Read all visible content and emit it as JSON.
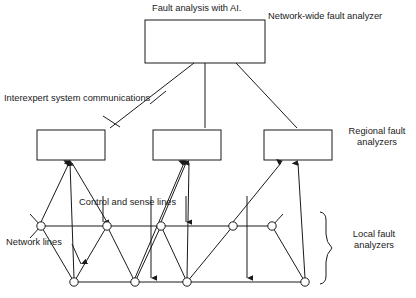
{
  "diagram": {
    "labels": {
      "top_box_caption": "Fault analysis with AI.",
      "network_wide": "Network-wide fault analyzer",
      "interexpert": "Interexpert system communications",
      "regional_line1": "Regional fault",
      "regional_line2": "analyzers",
      "control_sense": "Control and sense lines",
      "network_lines": "Network lines",
      "local_line1": "Local fault",
      "local_line2": "analyzers"
    },
    "colors": {
      "stroke": "#1a1a1a",
      "background": "#ffffff",
      "node_fill": "#ffffff"
    },
    "boxes": [
      {
        "name": "network-wide-fault-analyzer-box",
        "x": 145,
        "y": 20,
        "w": 120,
        "h": 43
      },
      {
        "name": "regional-fault-analyzer-box-left",
        "x": 37,
        "y": 130,
        "w": 68,
        "h": 30
      },
      {
        "name": "regional-fault-analyzer-box-center",
        "x": 153,
        "y": 130,
        "w": 68,
        "h": 30
      },
      {
        "name": "regional-fault-analyzer-box-right",
        "x": 264,
        "y": 130,
        "w": 68,
        "h": 30
      }
    ],
    "nodes_upper": [
      {
        "id": "n1",
        "x": 41,
        "y": 226
      },
      {
        "id": "n2",
        "x": 107,
        "y": 226
      },
      {
        "id": "n3",
        "x": 161,
        "y": 226
      },
      {
        "id": "n4",
        "x": 233,
        "y": 226
      },
      {
        "id": "n5",
        "x": 272,
        "y": 226
      }
    ],
    "nodes_lower": [
      {
        "id": "m1",
        "x": 74,
        "y": 282
      },
      {
        "id": "m2",
        "x": 135,
        "y": 282
      },
      {
        "id": "m3",
        "x": 187,
        "y": 282
      },
      {
        "id": "m4",
        "x": 305,
        "y": 282
      }
    ],
    "node_radius": 4.2,
    "brace": {
      "name": "local-fault-analyzers-brace",
      "x": 326,
      "y_top": 212,
      "y_bottom": 284
    }
  }
}
